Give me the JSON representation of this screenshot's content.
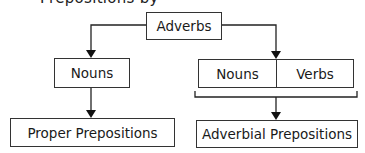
{
  "title_clipped": "Prepositions by",
  "diagram": {
    "root": {
      "label": "Adverbs"
    },
    "left_branch": {
      "middle": {
        "label": "Nouns"
      },
      "result": {
        "label": "Proper Prepositions"
      }
    },
    "right_branch": {
      "middle": [
        {
          "label": "Nouns"
        },
        {
          "label": "Verbs"
        }
      ],
      "result": {
        "label": "Adverbial Prepositions"
      }
    }
  },
  "colors": {
    "line": "#222222",
    "box_border": "#333333",
    "background": "#ffffff"
  }
}
